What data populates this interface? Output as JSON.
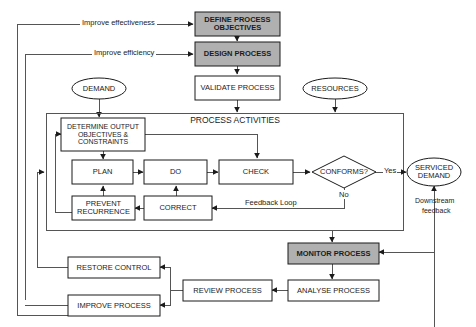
{
  "diagram": {
    "container_label": "PROCESS ACTIVITIES",
    "colors": {
      "shaded_fill": "#b0b0b0",
      "plain_fill": "#ffffff",
      "stroke": "#1b1b1b",
      "line": "#555555",
      "text": "#1b1b1b"
    },
    "nodes": {
      "define_process_objectives": {
        "label": "DEFINE PROCESS OBJECTIVES",
        "shape": "rect",
        "fill": "shaded"
      },
      "design_process": {
        "label": "DESIGN PROCESS",
        "shape": "rect",
        "fill": "shaded"
      },
      "validate_process": {
        "label": "VALIDATE PROCESS",
        "shape": "rect",
        "fill": "plain"
      },
      "demand": {
        "label": "DEMAND",
        "shape": "ellipse",
        "fill": "plain"
      },
      "resources": {
        "label": "RESOURCES",
        "shape": "ellipse",
        "fill": "plain"
      },
      "determine_output": {
        "label": "DETERMINE OUTPUT OBJECTIVES & CONSTRAINTS",
        "shape": "rect",
        "fill": "plain"
      },
      "plan": {
        "label": "PLAN",
        "shape": "rect",
        "fill": "plain"
      },
      "do": {
        "label": "DO",
        "shape": "rect",
        "fill": "plain"
      },
      "check": {
        "label": "CHECK",
        "shape": "rect",
        "fill": "plain"
      },
      "conforms": {
        "label": "CONFORMS?",
        "shape": "diamond",
        "fill": "plain"
      },
      "prevent_recurrence": {
        "label": "PREVENT RECURRENCE",
        "shape": "rect",
        "fill": "plain"
      },
      "correct": {
        "label": "CORRECT",
        "shape": "rect",
        "fill": "plain"
      },
      "serviced_demand": {
        "label": "SERVICED DEMAND",
        "shape": "ellipse",
        "fill": "plain"
      },
      "monitor_process": {
        "label": "MONITOR PROCESS",
        "shape": "rect",
        "fill": "shaded"
      },
      "analyse_process": {
        "label": "ANALYSE PROCESS",
        "shape": "rect",
        "fill": "plain"
      },
      "review_process": {
        "label": "REVIEW PROCESS",
        "shape": "rect",
        "fill": "plain"
      },
      "restore_control": {
        "label": "RESTORE CONTROL",
        "shape": "rect",
        "fill": "plain"
      },
      "improve_process": {
        "label": "IMPROVE PROCESS",
        "shape": "rect",
        "fill": "plain"
      }
    },
    "edge_labels": {
      "improve_effectiveness": "Improve effectiveness",
      "improve_efficiency": "Improve efficiency",
      "yes": "Yes",
      "no": "No",
      "feedback_loop": "Feedback Loop",
      "downstream_feedback_line1": "Downstream",
      "downstream_feedback_line2": "feedback"
    }
  }
}
